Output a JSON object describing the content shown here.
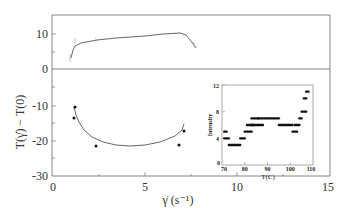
{
  "chart_data": {
    "type": "line",
    "title": "",
    "xlabel": "γ̇ (s⁻¹)",
    "ylabel": "T(γ̇) − T(0)",
    "xlim": [
      0,
      15
    ],
    "ylim": [
      -30,
      15
    ],
    "x_ticks": [
      "0",
      "5",
      "10",
      "15"
    ],
    "y_ticks": [
      "10",
      "0",
      "-10",
      "-20",
      "-30"
    ],
    "grid": false,
    "series": [
      {
        "name": "upper (positive) branch",
        "x": [
          1.0,
          1.2,
          1.5,
          2.0,
          3.5,
          5.0,
          6.0,
          6.8,
          7.2,
          7.6,
          7.9
        ],
        "y": [
          3.5,
          6.0,
          7.0,
          7.6,
          8.5,
          9.5,
          10.2,
          10.8,
          10.5,
          8.5,
          6.0
        ],
        "markers": [
          [
            1.0,
            3.5
          ],
          [
            1.2,
            7.5
          ],
          [
            3.5,
            8.6
          ],
          [
            7.5,
            8.5
          ]
        ]
      },
      {
        "name": "lower (negative) branch",
        "points": [
          [
            1.3,
            -10.5
          ],
          [
            1.2,
            -13.5
          ],
          [
            2.4,
            -21.5
          ],
          [
            6.8,
            -21.0
          ],
          [
            7.2,
            -17.5
          ]
        ],
        "fit": [
          [
            1.2,
            -10.5
          ],
          [
            1.6,
            -15.0
          ],
          [
            2.4,
            -20.0
          ],
          [
            3.5,
            -23.0
          ],
          [
            4.5,
            -24.0
          ],
          [
            5.5,
            -23.5
          ],
          [
            6.5,
            -21.5
          ],
          [
            7.2,
            -18.0
          ]
        ]
      }
    ],
    "inset": {
      "type": "scatter",
      "xlabel": "T(C)",
      "ylabel": "Intensity",
      "xlim": [
        70,
        110
      ],
      "ylim": [
        0,
        12
      ],
      "x_ticks": [
        "70",
        "80",
        "90",
        "100",
        "110"
      ],
      "y_ticks": [
        "0",
        "4",
        "8",
        "12"
      ],
      "segments": [
        {
          "x0": 71,
          "x1": 72,
          "y": 5
        },
        {
          "x0": 71,
          "x1": 73,
          "y": 4
        },
        {
          "x0": 73,
          "x1": 78,
          "y": 3
        },
        {
          "x0": 78,
          "x1": 80,
          "y": 4
        },
        {
          "x0": 80,
          "x1": 83,
          "y": 5
        },
        {
          "x0": 81,
          "x1": 84,
          "y": 6
        },
        {
          "x0": 83,
          "x1": 88,
          "y": 6
        },
        {
          "x0": 83,
          "x1": 86,
          "y": 7
        },
        {
          "x0": 86,
          "x1": 95,
          "y": 7
        },
        {
          "x0": 95,
          "x1": 101,
          "y": 6
        },
        {
          "x0": 101,
          "x1": 103,
          "y": 5
        },
        {
          "x0": 102,
          "x1": 104,
          "y": 6
        },
        {
          "x0": 104,
          "x1": 105,
          "y": 7
        },
        {
          "x0": 105,
          "x1": 107,
          "y": 8
        },
        {
          "x0": 106,
          "x1": 107,
          "y": 10
        },
        {
          "x0": 107,
          "x1": 108,
          "y": 11
        }
      ]
    }
  }
}
